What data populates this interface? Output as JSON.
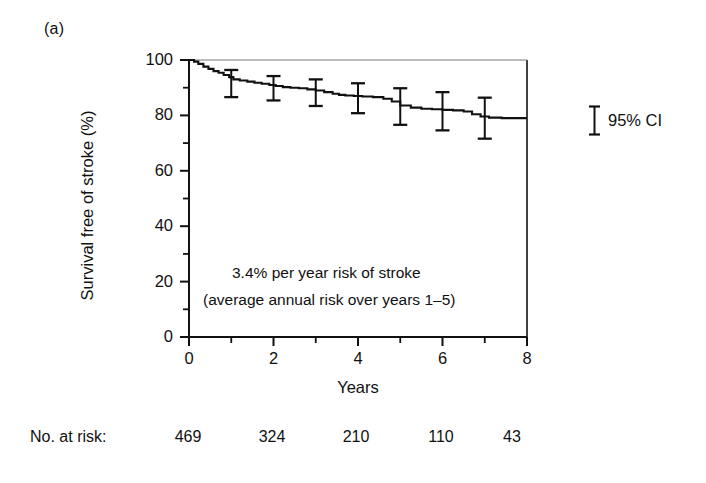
{
  "figure": {
    "panel_label": "(a)",
    "background_color": "#ffffff",
    "ink_color": "#111111"
  },
  "legend": {
    "label": "95% CI",
    "marker": "error-bar-marker"
  },
  "risk_table": {
    "title": "No. at risk:",
    "values": [
      "469",
      "324",
      "210",
      "110",
      "43"
    ],
    "x_positions": [
      188,
      272,
      356,
      441,
      512
    ]
  },
  "chart_data": {
    "type": "line",
    "subtype": "kaplan-meier-survival-step",
    "title": "",
    "xlabel": "Years",
    "ylabel": "Survival free of stroke (%)",
    "xlim": [
      0,
      8
    ],
    "ylim": [
      0,
      100
    ],
    "xticks_major": [
      0,
      2,
      4,
      6,
      8
    ],
    "xticks_major_labels": [
      "0",
      "2",
      "4",
      "6",
      "8"
    ],
    "xticks_minor": [
      1,
      3,
      5,
      7
    ],
    "yticks_major": [
      0,
      20,
      40,
      60,
      80,
      100
    ],
    "yticks_major_labels": [
      "0",
      "20",
      "40",
      "60",
      "80",
      "100"
    ],
    "yticks_minor": [
      10,
      30,
      50,
      70,
      90
    ],
    "grid": false,
    "legend_position": "right-outside",
    "annotations": [
      "3.4% per year risk of stroke",
      "(average annual risk over years 1–5)"
    ],
    "series": [
      {
        "name": "Survival free of stroke",
        "step_points": [
          [
            0.0,
            100.0
          ],
          [
            0.12,
            99.4
          ],
          [
            0.22,
            98.6
          ],
          [
            0.34,
            97.6
          ],
          [
            0.46,
            96.8
          ],
          [
            0.58,
            96.0
          ],
          [
            0.7,
            95.4
          ],
          [
            0.82,
            94.6
          ],
          [
            0.95,
            93.8
          ],
          [
            1.05,
            93.0
          ],
          [
            1.2,
            92.6
          ],
          [
            1.38,
            92.2
          ],
          [
            1.55,
            91.8
          ],
          [
            1.72,
            91.4
          ],
          [
            1.9,
            91.0
          ],
          [
            2.05,
            90.6
          ],
          [
            2.22,
            90.2
          ],
          [
            2.4,
            90.0
          ],
          [
            2.6,
            89.8
          ],
          [
            2.8,
            89.4
          ],
          [
            3.0,
            89.0
          ],
          [
            3.2,
            88.4
          ],
          [
            3.4,
            87.8
          ],
          [
            3.55,
            87.4
          ],
          [
            3.7,
            87.2
          ],
          [
            3.9,
            87.0
          ],
          [
            4.1,
            86.8
          ],
          [
            4.35,
            86.6
          ],
          [
            4.6,
            86.0
          ],
          [
            4.8,
            85.0
          ],
          [
            5.0,
            83.6
          ],
          [
            5.25,
            82.8
          ],
          [
            5.5,
            82.4
          ],
          [
            5.75,
            82.2
          ],
          [
            6.0,
            82.0
          ],
          [
            6.25,
            81.8
          ],
          [
            6.5,
            81.4
          ],
          [
            6.7,
            80.4
          ],
          [
            6.9,
            79.6
          ],
          [
            7.1,
            79.2
          ],
          [
            7.4,
            79.0
          ],
          [
            7.7,
            79.0
          ],
          [
            8.0,
            79.0
          ]
        ]
      }
    ],
    "error_bars": [
      {
        "x": 1,
        "y": 93.0,
        "low": 86.6,
        "high": 96.4
      },
      {
        "x": 2,
        "y": 90.6,
        "low": 85.4,
        "high": 94.2
      },
      {
        "x": 3,
        "y": 89.0,
        "low": 83.4,
        "high": 93.0
      },
      {
        "x": 4,
        "y": 86.8,
        "low": 80.8,
        "high": 91.6
      },
      {
        "x": 5,
        "y": 83.6,
        "low": 76.6,
        "high": 89.8
      },
      {
        "x": 6,
        "y": 82.0,
        "low": 74.6,
        "high": 88.4
      },
      {
        "x": 7,
        "y": 79.2,
        "low": 71.6,
        "high": 86.4
      }
    ]
  }
}
